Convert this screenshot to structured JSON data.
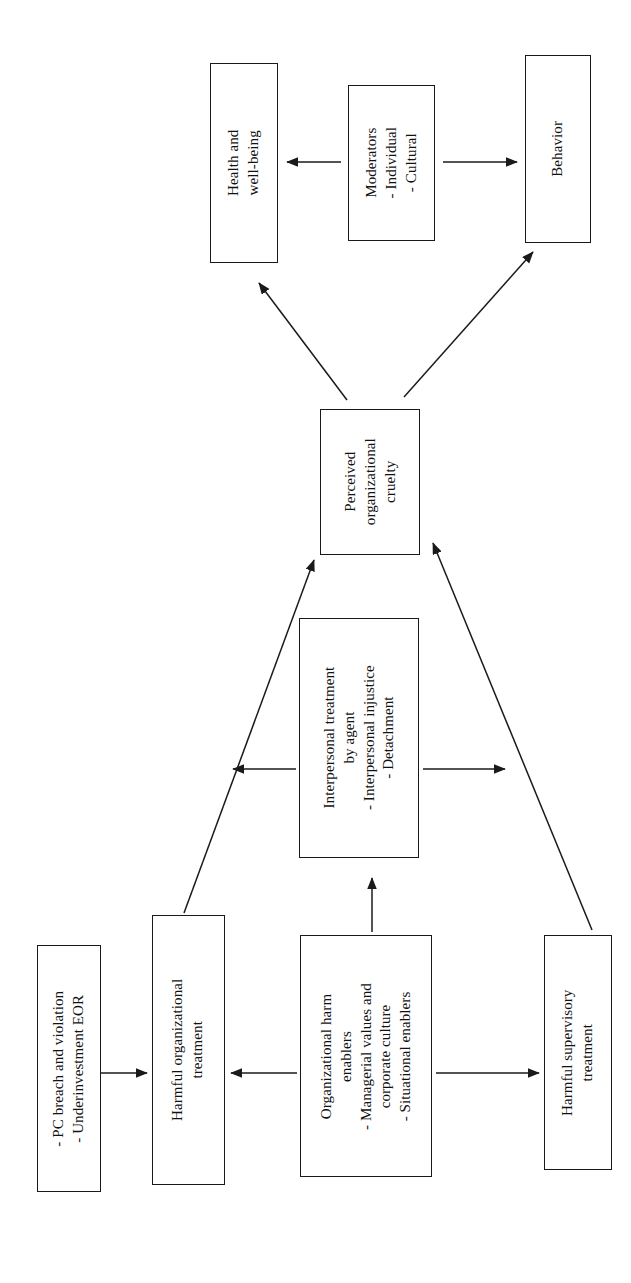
{
  "diagram": {
    "background_color": "#ffffff",
    "line_color": "#1a1a1a",
    "text_color": "#111111",
    "orientation": "rotated-90-ccw",
    "nodes": [
      {
        "id": "health-well-being",
        "name": "health-and-well-being-box",
        "lines": [
          "Health and",
          "well-being"
        ]
      },
      {
        "id": "moderators",
        "name": "moderators-box",
        "lines": [
          "Moderators",
          "- Individual",
          "- Cultural"
        ]
      },
      {
        "id": "behavior",
        "name": "behavior-box",
        "lines": [
          "Behavior"
        ]
      },
      {
        "id": "perceived-organizational-cruelty",
        "name": "perceived-organizational-cruelty-box",
        "lines": [
          "Perceived",
          "organizational",
          "cruelty"
        ]
      },
      {
        "id": "interpersonal-treatment",
        "name": "interpersonal-treatment-by-agent-box",
        "lines": [
          "Interpersonal treatment",
          "by agent",
          "- Interpersonal injustice",
          "- Detachment"
        ]
      },
      {
        "id": "pc-breach",
        "name": "pc-breach-and-underinvestment-box",
        "lines": [
          "- PC breach and violation",
          "- Underinvestment EOR"
        ]
      },
      {
        "id": "harmful-organizational-treatment",
        "name": "harmful-organizational-treatment-box",
        "lines": [
          "Harmful organizational",
          "treatment"
        ]
      },
      {
        "id": "organizational-harm-enablers",
        "name": "organizational-harm-enablers-box",
        "lines": [
          "Organizational harm",
          "enablers",
          "- Managerial values and",
          "corporate culture",
          "- Situational enablers"
        ]
      },
      {
        "id": "harmful-supervisory-treatment",
        "name": "harmful-supervisory-treatment-box",
        "lines": [
          "Harmful supervisory",
          "treatment"
        ]
      }
    ],
    "edges": [
      {
        "id": "e1",
        "name": "arrow-moderators-to-health",
        "from": "moderators",
        "to": "health-well-being",
        "style": "straight"
      },
      {
        "id": "e2",
        "name": "arrow-moderators-to-behavior",
        "from": "moderators",
        "to": "behavior",
        "style": "straight"
      },
      {
        "id": "e3",
        "name": "arrow-cruelty-to-health",
        "from": "perceived-organizational-cruelty",
        "to": "health-well-being",
        "style": "diagonal"
      },
      {
        "id": "e4",
        "name": "arrow-cruelty-to-behavior",
        "from": "perceived-organizational-cruelty",
        "to": "behavior",
        "style": "diagonal"
      },
      {
        "id": "e5",
        "name": "arrow-harmful-org-treatment-to-cruelty",
        "from": "harmful-organizational-treatment",
        "to": "perceived-organizational-cruelty",
        "style": "diagonal"
      },
      {
        "id": "e6",
        "name": "arrow-harmful-supervisory-to-cruelty",
        "from": "harmful-supervisory-treatment",
        "to": "perceived-organizational-cruelty",
        "style": "diagonal"
      },
      {
        "id": "e7",
        "name": "arrow-interpersonal-to-cruelty-left",
        "from": "interpersonal-treatment",
        "to": "perceived-organizational-cruelty",
        "style": "straight"
      },
      {
        "id": "e8",
        "name": "arrow-interpersonal-to-supervisory",
        "from": "interpersonal-treatment",
        "to": "harmful-supervisory-treatment",
        "style": "straight"
      },
      {
        "id": "e9",
        "name": "arrow-enablers-to-interpersonal",
        "from": "organizational-harm-enablers",
        "to": "interpersonal-treatment",
        "style": "straight"
      },
      {
        "id": "e10",
        "name": "arrow-pc-breach-to-harmful-org",
        "from": "pc-breach",
        "to": "harmful-organizational-treatment",
        "style": "straight"
      },
      {
        "id": "e11",
        "name": "arrow-enablers-to-harmful-org",
        "from": "organizational-harm-enablers",
        "to": "harmful-organizational-treatment",
        "style": "straight"
      },
      {
        "id": "e12",
        "name": "arrow-enablers-to-harmful-supervisory",
        "from": "organizational-harm-enablers",
        "to": "harmful-supervisory-treatment",
        "style": "straight"
      }
    ]
  }
}
